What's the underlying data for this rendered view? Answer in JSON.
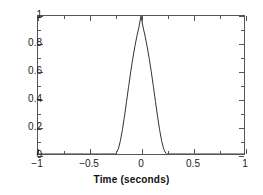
{
  "chart_data": {
    "type": "line",
    "title": "",
    "xlabel": "Time (seconds)",
    "ylabel": "",
    "xlim": [
      -1,
      1
    ],
    "ylim": [
      0,
      1
    ],
    "grid": false,
    "legend": null,
    "xticks": [
      -1,
      -0.5,
      0,
      0.5,
      1
    ],
    "xticklabels": [
      "-1",
      "-0.5",
      "0",
      "0.5",
      "1"
    ],
    "yticks": [
      0,
      0.2,
      0.4,
      0.6,
      0.8,
      1
    ],
    "yticklabels": [
      "0",
      "0.2",
      "0.4",
      "0.6",
      "0.8",
      "1"
    ],
    "x_minor_ticks": [
      -0.75,
      -0.25,
      0.25,
      0.75
    ],
    "y_minor_ticks": [
      0.1,
      0.3,
      0.5,
      0.7,
      0.9
    ],
    "line_color": "#333333",
    "line_width": 1,
    "series": [
      {
        "name": "pulse",
        "x": [
          -1,
          -0.95,
          -0.9,
          -0.85,
          -0.8,
          -0.75,
          -0.7,
          -0.65,
          -0.6,
          -0.55,
          -0.5,
          -0.45,
          -0.4,
          -0.35,
          -0.3,
          -0.26,
          -0.25,
          -0.24,
          -0.22,
          -0.2,
          -0.18,
          -0.16,
          -0.14,
          -0.12,
          -0.1,
          -0.08,
          -0.06,
          -0.04,
          -0.02,
          0,
          0.02,
          0.04,
          0.06,
          0.08,
          0.1,
          0.12,
          0.14,
          0.16,
          0.18,
          0.2,
          0.22,
          0.24,
          0.25,
          0.26,
          0.3,
          0.35,
          0.4,
          0.45,
          0.5,
          0.55,
          0.6,
          0.65,
          0.7,
          0.75,
          0.8,
          0.85,
          0.9,
          0.95,
          1
        ],
        "y": [
          0,
          0,
          0,
          0,
          0,
          0,
          0,
          0,
          0,
          0,
          0,
          0,
          0,
          0,
          0,
          0,
          0,
          0.006,
          0.037,
          0.096,
          0.178,
          0.276,
          0.382,
          0.49,
          0.595,
          0.691,
          0.777,
          0.854,
          0.92,
          1,
          0.92,
          0.854,
          0.777,
          0.691,
          0.595,
          0.49,
          0.382,
          0.276,
          0.178,
          0.096,
          0.037,
          0.006,
          0,
          0,
          0,
          0,
          0,
          0,
          0,
          0,
          0,
          0,
          0,
          0,
          0,
          0,
          0,
          0,
          0
        ]
      }
    ]
  }
}
